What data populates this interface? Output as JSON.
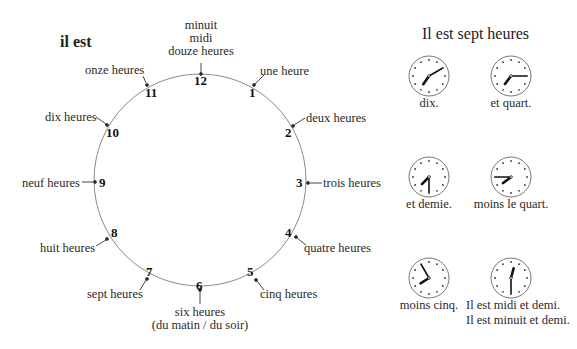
{
  "main_clock": {
    "title": "il est",
    "hours": [
      {
        "num": "12",
        "label": [
          "minuit",
          "midi",
          "douze heures"
        ]
      },
      {
        "num": "1",
        "label": [
          "une heure"
        ]
      },
      {
        "num": "2",
        "label": [
          "deux heures"
        ]
      },
      {
        "num": "3",
        "label": [
          "trois heures"
        ]
      },
      {
        "num": "4",
        "label": [
          "quatre heures"
        ]
      },
      {
        "num": "5",
        "label": [
          "cinq heures"
        ]
      },
      {
        "num": "6",
        "label": [
          "six heures",
          "(du matin / du soir)"
        ]
      },
      {
        "num": "7",
        "label": [
          "sept heures"
        ]
      },
      {
        "num": "8",
        "label": [
          "huit heures"
        ]
      },
      {
        "num": "9",
        "label": [
          "neuf heures"
        ]
      },
      {
        "num": "10",
        "label": [
          "dix heures"
        ]
      },
      {
        "num": "11",
        "label": [
          "onze heures"
        ]
      }
    ]
  },
  "side_panel": {
    "title": "Il est sept heures",
    "clocks": [
      {
        "caption": "dix.",
        "time": "7:10"
      },
      {
        "caption": "et quart.",
        "time": "7:15"
      },
      {
        "caption": "et demie.",
        "time": "7:30"
      },
      {
        "caption": "moins le quart.",
        "time": "7:45"
      },
      {
        "caption": "moins cinq.",
        "time": "7:55"
      },
      {
        "caption": "Il est midi et demi.",
        "caption2": "Il est minuit et demi.",
        "time": "12:30"
      }
    ]
  },
  "colors": {
    "circle": "#888888",
    "ink": "#222222"
  }
}
